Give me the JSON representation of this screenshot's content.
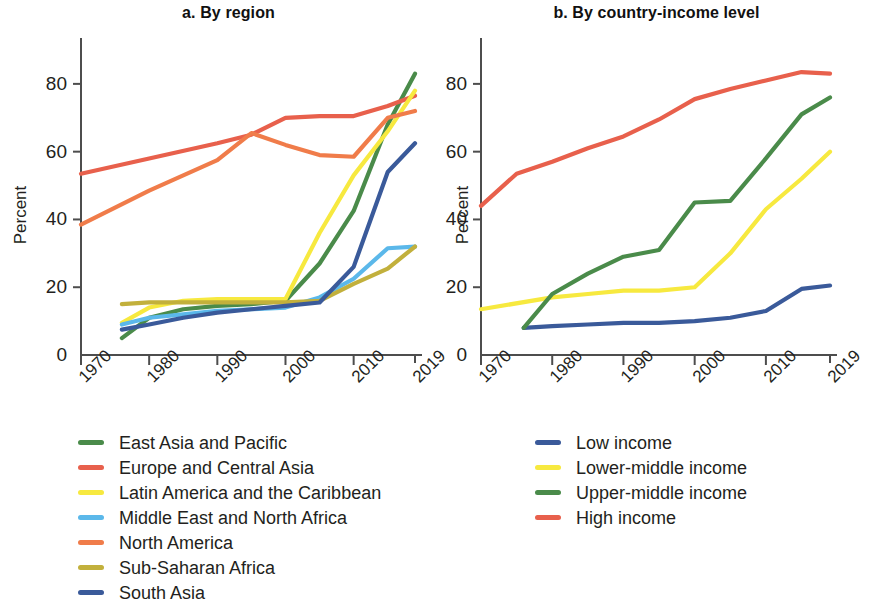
{
  "chart_data": [
    {
      "type": "line",
      "title": "a. By region",
      "xlabel": "",
      "ylabel": "Percent",
      "xlim": [
        1970,
        2019
      ],
      "ylim": [
        0,
        90
      ],
      "yticks": [
        0,
        20,
        40,
        60,
        80
      ],
      "xticks": [
        1970,
        1980,
        1990,
        2000,
        2010,
        2019
      ],
      "xtick_labels": [
        "1970",
        "1980",
        "1990",
        "2000",
        "2010",
        "2019"
      ],
      "ytick_labels": [
        "0",
        "20",
        "40",
        "60",
        "80"
      ],
      "grid": false,
      "legend_position": "below",
      "series": [
        {
          "name": "East Asia and Pacific",
          "color": "#4a8b4a",
          "x": [
            1976,
            1980,
            1985,
            1990,
            1995,
            2000,
            2005,
            2010,
            2015,
            2019
          ],
          "values": [
            5,
            11,
            13.5,
            14.5,
            15,
            16,
            27,
            42.5,
            68,
            83
          ]
        },
        {
          "name": "Europe and Central Asia",
          "color": "#e8604c",
          "x": [
            1970,
            1980,
            1990,
            1995,
            2000,
            2005,
            2010,
            2015,
            2019
          ],
          "values": [
            53.5,
            58,
            62.5,
            65,
            70,
            70.5,
            70.5,
            73.5,
            76.5
          ]
        },
        {
          "name": "Latin America and the Caribbean",
          "color": "#f7e93f",
          "x": [
            1976,
            1980,
            1985,
            1990,
            1995,
            2000,
            2005,
            2010,
            2015,
            2019
          ],
          "values": [
            9.5,
            14,
            16,
            16.5,
            16.5,
            16.5,
            36,
            53,
            66,
            78
          ]
        },
        {
          "name": "Middle East and North Africa",
          "color": "#5bb8ea",
          "x": [
            1976,
            1980,
            1985,
            1990,
            1995,
            2000,
            2005,
            2010,
            2015,
            2019
          ],
          "values": [
            9,
            11,
            12,
            13,
            13.5,
            14,
            17,
            22.5,
            31.5,
            32
          ]
        },
        {
          "name": "North America",
          "color": "#f07c4a",
          "x": [
            1970,
            1980,
            1990,
            1995,
            2000,
            2005,
            2010,
            2015,
            2019
          ],
          "values": [
            38.5,
            48.5,
            57.5,
            65.5,
            62,
            59,
            58.5,
            70,
            72
          ]
        },
        {
          "name": "Sub-Saharan Africa",
          "color": "#c2b03c",
          "x": [
            1976,
            1980,
            1985,
            1990,
            1995,
            2000,
            2005,
            2010,
            2015,
            2019
          ],
          "values": [
            15,
            15.5,
            15.5,
            15.5,
            15.5,
            15.5,
            16,
            21,
            25.5,
            32
          ]
        },
        {
          "name": "South Asia",
          "color": "#3a5a9a",
          "x": [
            1976,
            1980,
            1985,
            1990,
            1995,
            2000,
            2005,
            2010,
            2015,
            2019
          ],
          "values": [
            7.5,
            9,
            11,
            12.5,
            13.5,
            14.5,
            15.5,
            26,
            54,
            62.5
          ]
        }
      ]
    },
    {
      "type": "line",
      "title": "b. By country-income level",
      "xlabel": "",
      "ylabel": "Percent",
      "xlim": [
        1970,
        2019
      ],
      "ylim": [
        0,
        90
      ],
      "yticks": [
        0,
        20,
        40,
        60,
        80
      ],
      "xticks": [
        1970,
        1980,
        1990,
        2000,
        2010,
        2019
      ],
      "xtick_labels": [
        "1970",
        "1980",
        "1990",
        "2000",
        "2010",
        "2019"
      ],
      "ytick_labels": [
        "0",
        "20",
        "40",
        "60",
        "80"
      ],
      "grid": false,
      "legend_position": "below",
      "series": [
        {
          "name": "Low income",
          "color": "#3a5a9a",
          "x": [
            1976,
            1980,
            1985,
            1990,
            1995,
            2000,
            2005,
            2010,
            2015,
            2019
          ],
          "values": [
            8,
            8.5,
            9,
            9.5,
            9.5,
            10,
            11,
            13,
            19.5,
            20.5
          ]
        },
        {
          "name": "Lower-middle income",
          "color": "#f7e93f",
          "x": [
            1970,
            1980,
            1985,
            1990,
            1995,
            2000,
            2005,
            2010,
            2015,
            2019
          ],
          "values": [
            13.5,
            17,
            18,
            19,
            19,
            20,
            30,
            43,
            52,
            60
          ]
        },
        {
          "name": "Upper-middle income",
          "color": "#4a8b4a",
          "x": [
            1976,
            1980,
            1985,
            1990,
            1995,
            2000,
            2005,
            2010,
            2015,
            2019
          ],
          "values": [
            8,
            18,
            24,
            29,
            31,
            45,
            45.5,
            58,
            71,
            76
          ]
        },
        {
          "name": "High income",
          "color": "#e8604c",
          "x": [
            1970,
            1975,
            1980,
            1985,
            1990,
            1995,
            2000,
            2005,
            2010,
            2015,
            2019
          ],
          "values": [
            44,
            53.5,
            57,
            61,
            64.5,
            69.5,
            75.5,
            78.5,
            81,
            83.5,
            83
          ]
        }
      ]
    }
  ],
  "panels": [
    {
      "title": "a. By region",
      "ylabel": "Percent",
      "ytick_labels": [
        "0",
        "20",
        "40",
        "60",
        "80"
      ],
      "xtick_labels": [
        "1970",
        "1980",
        "1990",
        "2000",
        "2010",
        "2019"
      ],
      "legend": [
        {
          "label": "East Asia and Pacific",
          "color": "#4a8b4a"
        },
        {
          "label": "Europe and Central Asia",
          "color": "#e8604c"
        },
        {
          "label": "Latin America and the Caribbean",
          "color": "#f7e93f"
        },
        {
          "label": "Middle East and North Africa",
          "color": "#5bb8ea"
        },
        {
          "label": "North America",
          "color": "#f07c4a"
        },
        {
          "label": "Sub-Saharan Africa",
          "color": "#c2b03c"
        },
        {
          "label": "South Asia",
          "color": "#3a5a9a"
        }
      ]
    },
    {
      "title": "b. By country-income level",
      "ylabel": "Percent",
      "ytick_labels": [
        "0",
        "20",
        "40",
        "60",
        "80"
      ],
      "xtick_labels": [
        "1970",
        "1980",
        "1990",
        "2000",
        "2010",
        "2019"
      ],
      "legend": [
        {
          "label": "Low income",
          "color": "#3a5a9a"
        },
        {
          "label": "Lower-middle income",
          "color": "#f7e93f"
        },
        {
          "label": "Upper-middle income",
          "color": "#4a8b4a"
        },
        {
          "label": "High income",
          "color": "#e8604c"
        }
      ]
    }
  ]
}
